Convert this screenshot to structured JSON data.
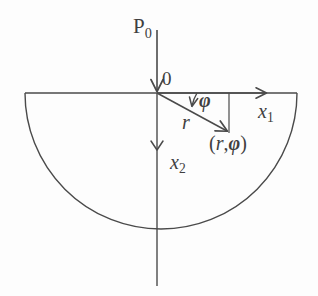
{
  "figure": {
    "background_color": "#fdfdfd",
    "stroke_color": "#4a4a4a",
    "width": 318,
    "height": 296
  },
  "labels": {
    "load": "P",
    "load_subscript": "0",
    "origin": "0",
    "axis_x1": "x",
    "axis_x1_subscript": "1",
    "axis_x2": "x",
    "axis_x2_subscript": "2",
    "radius": "r",
    "angle": "φ",
    "point_open": "(",
    "point_r": "r",
    "point_comma": ",",
    "point_phi": "φ",
    "point_close": ")"
  },
  "geometry": {
    "origin": {
      "x": 157,
      "y": 93
    },
    "semicircle": {
      "cx": 161,
      "cy": 93,
      "r": 136,
      "bottom_y": 229
    },
    "surface_line": {
      "x1": 25,
      "y1": 93,
      "x2": 297,
      "y2": 93
    },
    "load_arrow": {
      "x1": 157,
      "y1": 30,
      "x2": 157,
      "y2": 93
    },
    "x2_axis": {
      "x1": 157,
      "y1": 93,
      "x2": 157,
      "y2": 286,
      "arrow_y": 150
    },
    "x1_axis_arrow": {
      "x1": 157,
      "y1": 93,
      "x2": 270,
      "y2": 93
    },
    "radius_vector": {
      "x1": 157,
      "y1": 93,
      "x2": 230,
      "y2": 133
    },
    "drop_line": {
      "x1": 229,
      "y1": 93,
      "x2": 229,
      "y2": 133
    },
    "angle_arc": {
      "cx": 157,
      "cy": 93,
      "radius": 40,
      "from_deg": 0,
      "to_deg": 28
    }
  }
}
